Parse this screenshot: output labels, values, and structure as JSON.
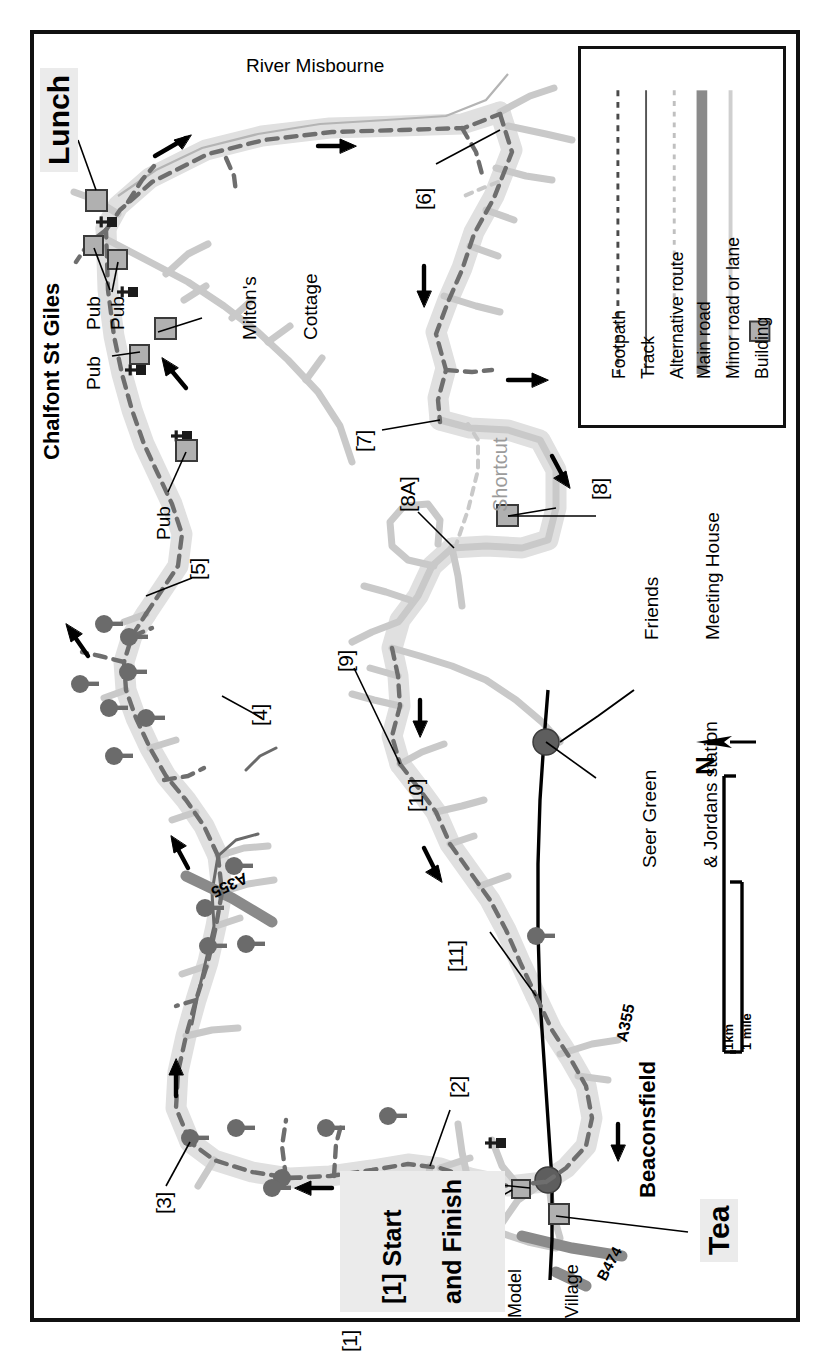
{
  "map": {
    "type": "walking-route-map",
    "region": "Chalfont St Giles / Beaconsfield circular walk",
    "orientation_note": "map body drawn rotated 90 degrees; north arrow points left",
    "river_label": "River Misbourne",
    "north_label": "N",
    "colors": {
      "frame": "#111111",
      "route_corridor": "#e0e0e0",
      "footpath": "#6e6e6e",
      "main_road": "#8a8a8a",
      "minor_road": "#c9c9c9",
      "building_fill": "#b0b0b0",
      "building_stroke": "#3a3a3a",
      "tree": "#6b6b6b",
      "railway": "#000000",
      "shortcut_text": "#9b9b9b",
      "highlight": "#ebebeb"
    }
  },
  "legend": {
    "items": [
      {
        "label": "Footpath",
        "swatch": "dashed-dark"
      },
      {
        "label": "Track",
        "swatch": "solid-thin-dark"
      },
      {
        "label": "Alternative route",
        "swatch": "dotted-light"
      },
      {
        "label": "Main road",
        "swatch": "thick-grey"
      },
      {
        "label": "Minor road or lane",
        "swatch": "thin-lightgrey"
      },
      {
        "label": "Building",
        "swatch": "grey-square"
      }
    ]
  },
  "scale_bar": {
    "km_label": "1km",
    "mile_label": "1 mile"
  },
  "waypoints": [
    {
      "id": "1",
      "label": "[1]"
    },
    {
      "id": "2",
      "label": "[2]"
    },
    {
      "id": "3",
      "label": "[3]"
    },
    {
      "id": "4",
      "label": "[4]"
    },
    {
      "id": "5",
      "label": "[5]"
    },
    {
      "id": "6",
      "label": "[6]"
    },
    {
      "id": "7",
      "label": "[7]"
    },
    {
      "id": "8",
      "label": "[8]"
    },
    {
      "id": "8A",
      "label": "[8A]"
    },
    {
      "id": "9",
      "label": "[9]"
    },
    {
      "id": "10",
      "label": "[10]"
    },
    {
      "id": "11",
      "label": "[11]"
    }
  ],
  "annotations": {
    "lunch": "Lunch",
    "tea": "Tea",
    "start_finish_line1": "[1] Start",
    "start_finish_line2": "and Finish",
    "chalfont": "Chalfont St Giles",
    "beaconsfield": "Beaconsfield",
    "miltons_cottage_line1": "Milton's",
    "miltons_cottage_line2": "Cottage",
    "model_village_line1": "Model",
    "model_village_line2": "Village",
    "friends_line1": "Friends",
    "friends_line2": "Meeting House",
    "station_line1": "Seer Green",
    "station_line2": "& Jordans station",
    "shortcut": "Shortcut",
    "pub_1": "Pub",
    "pub_2": "Pub",
    "pub_3": "Pub",
    "pub_4": "Pub",
    "road_a355_top": "A355",
    "road_a355_bottom": "A355",
    "road_b474": "B474"
  }
}
